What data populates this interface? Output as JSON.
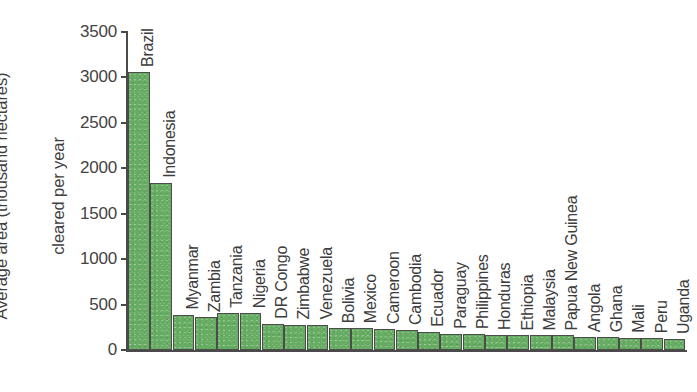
{
  "chart_data": {
    "type": "bar",
    "title": "",
    "xlabel": "",
    "ylabel": "Average area (thousand hectares)\ncleared per year",
    "ylabel_line1": "Average area (thousand hectares)",
    "ylabel_line2": "cleared per year",
    "ylim": [
      0,
      3500
    ],
    "ytick_values": [
      0,
      500,
      1000,
      1500,
      2000,
      2500,
      3000,
      3500
    ],
    "ytick_labels": [
      "0",
      "500",
      "1000",
      "1500",
      "2000",
      "2500",
      "3000",
      "3500"
    ],
    "grid": false,
    "legend": false,
    "bar_color": "#66ac62",
    "bar_edge_color": "#4c4c4c",
    "axis_color": "#4a4a4a",
    "text_color": "#3c3c3c",
    "categories": [
      "Brazil",
      "Indonesia",
      "Myanmar",
      "Zambia",
      "Tanzania",
      "Nigeria",
      "DR Congo",
      "Zimbabwe",
      "Venezuela",
      "Bolivia",
      "Mexico",
      "Cameroon",
      "Cambodia",
      "Ecuador",
      "Paraguay",
      "Philippines",
      "Honduras",
      "Ethiopia",
      "Malaysia",
      "Papua New Guinea",
      "Angola",
      "Ghana",
      "Mali",
      "Peru",
      "Uganda"
    ],
    "values": [
      3060,
      1840,
      390,
      360,
      410,
      405,
      290,
      280,
      280,
      240,
      240,
      230,
      220,
      200,
      180,
      175,
      165,
      160,
      160,
      160,
      140,
      140,
      135,
      130,
      120
    ]
  }
}
